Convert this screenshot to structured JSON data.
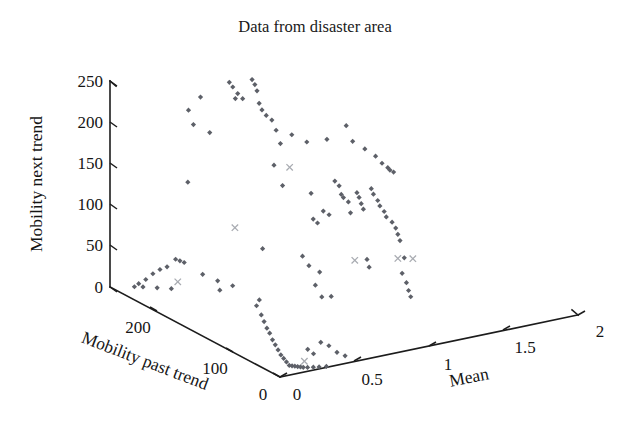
{
  "chart_data": {
    "type": "scatter",
    "projection": "3d",
    "title": "Data from disaster area",
    "xlabel": "Mean",
    "ylabel": "Mobility past trend",
    "zlabel": "Mobility next trend",
    "grid": false,
    "legend": "none",
    "axes": {
      "mean": {
        "label": "Mean",
        "ticks": [
          0,
          0.5,
          1,
          1.5,
          2
        ],
        "tick_labels": [
          "0",
          "0.5",
          "1",
          "1.5",
          "2"
        ],
        "range": [
          0,
          2
        ]
      },
      "mobility_past_trend": {
        "label": "Mobility past trend",
        "ticks": [
          0,
          100,
          200
        ],
        "tick_labels": [
          "0",
          "100",
          "200"
        ],
        "range": [
          0,
          260
        ]
      },
      "mobility_next_trend": {
        "label": "Mobility next trend",
        "ticks": [
          0,
          50,
          100,
          150,
          200,
          250
        ],
        "tick_labels": [
          "0",
          "50",
          "100",
          "150",
          "200",
          "250"
        ],
        "range": [
          0,
          265
        ]
      }
    },
    "series": [
      {
        "name": "observations",
        "marker": "diamond",
        "color": "#5d6068",
        "points": [
          {
            "mean": 0.52,
            "past": 196,
            "next": 271
          },
          {
            "mean": 0.53,
            "past": 193,
            "next": 266
          },
          {
            "mean": 0.55,
            "past": 190,
            "next": 258
          },
          {
            "mean": 0.57,
            "past": 187,
            "next": 252
          },
          {
            "mean": 0.62,
            "past": 184,
            "next": 276
          },
          {
            "mean": 0.63,
            "past": 182,
            "next": 270
          },
          {
            "mean": 0.64,
            "past": 181,
            "next": 262
          },
          {
            "mean": 0.65,
            "past": 180,
            "next": 246
          },
          {
            "mean": 0.66,
            "past": 178,
            "next": 238
          },
          {
            "mean": 0.68,
            "past": 176,
            "next": 231
          },
          {
            "mean": 0.6,
            "past": 205,
            "next": 243
          },
          {
            "mean": 0.41,
            "past": 215,
            "next": 248
          },
          {
            "mean": 0.36,
            "past": 222,
            "next": 230
          },
          {
            "mean": 0.38,
            "past": 219,
            "next": 212
          },
          {
            "mean": 0.45,
            "past": 210,
            "next": 203
          },
          {
            "mean": 0.7,
            "past": 172,
            "next": 226
          },
          {
            "mean": 0.72,
            "past": 170,
            "next": 213
          },
          {
            "mean": 0.74,
            "past": 168,
            "next": 196
          },
          {
            "mean": 0.79,
            "past": 162,
            "next": 208
          },
          {
            "mean": 0.86,
            "past": 155,
            "next": 199
          },
          {
            "mean": 0.96,
            "past": 147,
            "next": 202
          },
          {
            "mean": 1.05,
            "past": 138,
            "next": 220
          },
          {
            "mean": 1.08,
            "past": 135,
            "next": 200
          },
          {
            "mean": 1.14,
            "past": 130,
            "next": 190
          },
          {
            "mean": 1.19,
            "past": 125,
            "next": 181
          },
          {
            "mean": 1.22,
            "past": 122,
            "next": 172
          },
          {
            "mean": 1.25,
            "past": 120,
            "next": 166
          },
          {
            "mean": 1.26,
            "past": 119,
            "next": 163
          },
          {
            "mean": 1.28,
            "past": 118,
            "next": 160
          },
          {
            "mean": 0.71,
            "past": 171,
            "next": 168
          },
          {
            "mean": 0.75,
            "past": 167,
            "next": 142
          },
          {
            "mean": 0.36,
            "past": 223,
            "next": 137
          },
          {
            "mean": 0.88,
            "past": 153,
            "next": 133
          },
          {
            "mean": 1.0,
            "past": 144,
            "next": 148
          },
          {
            "mean": 1.02,
            "past": 142,
            "next": 142
          },
          {
            "mean": 1.03,
            "past": 141,
            "next": 131
          },
          {
            "mean": 1.04,
            "past": 140,
            "next": 127
          },
          {
            "mean": 1.06,
            "past": 137,
            "next": 122
          },
          {
            "mean": 1.1,
            "past": 133,
            "next": 134
          },
          {
            "mean": 1.11,
            "past": 132,
            "next": 128
          },
          {
            "mean": 1.12,
            "past": 131,
            "next": 120
          },
          {
            "mean": 1.13,
            "past": 130,
            "next": 113
          },
          {
            "mean": 1.17,
            "past": 127,
            "next": 139
          },
          {
            "mean": 1.18,
            "past": 126,
            "next": 132
          },
          {
            "mean": 1.2,
            "past": 124,
            "next": 124
          },
          {
            "mean": 1.21,
            "past": 123,
            "next": 117
          },
          {
            "mean": 1.23,
            "past": 121,
            "next": 110
          },
          {
            "mean": 1.24,
            "past": 120,
            "next": 103
          },
          {
            "mean": 1.27,
            "past": 118,
            "next": 96
          },
          {
            "mean": 1.29,
            "past": 117,
            "next": 88
          },
          {
            "mean": 1.3,
            "past": 116,
            "next": 80
          },
          {
            "mean": 1.31,
            "past": 115,
            "next": 72
          },
          {
            "mean": 0.89,
            "past": 152,
            "next": 100
          },
          {
            "mean": 0.91,
            "past": 150,
            "next": 95
          },
          {
            "mean": 0.94,
            "past": 148,
            "next": 110
          },
          {
            "mean": 0.97,
            "past": 146,
            "next": 105
          },
          {
            "mean": 1.07,
            "past": 136,
            "next": 108
          },
          {
            "mean": 0.66,
            "past": 177,
            "next": 60
          },
          {
            "mean": 0.84,
            "past": 157,
            "next": 52
          },
          {
            "mean": 1.15,
            "past": 129,
            "next": 48
          },
          {
            "mean": 1.33,
            "past": 113,
            "next": 50
          },
          {
            "mean": 0.87,
            "past": 154,
            "next": 40
          },
          {
            "mean": 0.92,
            "past": 149,
            "next": 32
          },
          {
            "mean": 1.16,
            "past": 128,
            "next": 38
          },
          {
            "mean": 1.32,
            "past": 114,
            "next": 30
          },
          {
            "mean": 0.3,
            "past": 228,
            "next": 38
          },
          {
            "mean": 0.32,
            "past": 226,
            "next": 36
          },
          {
            "mean": 0.34,
            "past": 224,
            "next": 34
          },
          {
            "mean": 0.26,
            "past": 232,
            "next": 28
          },
          {
            "mean": 0.23,
            "past": 236,
            "next": 24
          },
          {
            "mean": 0.2,
            "past": 240,
            "next": 18
          },
          {
            "mean": 0.17,
            "past": 244,
            "next": 10
          },
          {
            "mean": 0.14,
            "past": 248,
            "next": 4
          },
          {
            "mean": 0.42,
            "past": 214,
            "next": 20
          },
          {
            "mean": 0.49,
            "past": 207,
            "next": 12
          },
          {
            "mean": 0.56,
            "past": 200,
            "next": 6
          },
          {
            "mean": 0.9,
            "past": 151,
            "next": 15
          },
          {
            "mean": 1.34,
            "past": 112,
            "next": 18
          },
          {
            "mean": 1.35,
            "past": 111,
            "next": 8
          },
          {
            "mean": 0.12,
            "past": 250,
            "next": 0
          },
          {
            "mean": 0.16,
            "past": 246,
            "next": 0
          },
          {
            "mean": 0.22,
            "past": 238,
            "next": 0
          },
          {
            "mean": 0.28,
            "past": 230,
            "next": 0
          },
          {
            "mean": 0.5,
            "past": 206,
            "next": 0
          },
          {
            "mean": 0.93,
            "past": 148,
            "next": 0
          },
          {
            "mean": 0.98,
            "past": 145,
            "next": 0
          },
          {
            "mean": 1.36,
            "past": 110,
            "next": 0
          },
          {
            "mean": 0.05,
            "past": 40,
            "next": 60
          },
          {
            "mean": 0.06,
            "past": 38,
            "next": 52
          },
          {
            "mean": 0.07,
            "past": 36,
            "next": 44
          },
          {
            "mean": 0.08,
            "past": 34,
            "next": 38
          },
          {
            "mean": 0.09,
            "past": 32,
            "next": 30
          },
          {
            "mean": 0.1,
            "past": 30,
            "next": 24
          },
          {
            "mean": 0.11,
            "past": 28,
            "next": 18
          },
          {
            "mean": 0.12,
            "past": 26,
            "next": 12
          },
          {
            "mean": 0.13,
            "past": 24,
            "next": 8
          },
          {
            "mean": 0.14,
            "past": 22,
            "next": 4
          },
          {
            "mean": 0.15,
            "past": 20,
            "next": 0
          },
          {
            "mean": 0.16,
            "past": 18,
            "next": 0
          },
          {
            "mean": 0.17,
            "past": 16,
            "next": 0
          },
          {
            "mean": 0.18,
            "past": 14,
            "next": 0
          },
          {
            "mean": 0.19,
            "past": 12,
            "next": 0
          },
          {
            "mean": 0.2,
            "past": 10,
            "next": 0
          },
          {
            "mean": 0.22,
            "past": 8,
            "next": 0
          },
          {
            "mean": 0.25,
            "past": 6,
            "next": 0
          },
          {
            "mean": 0.28,
            "past": 4,
            "next": 0
          },
          {
            "mean": 0.32,
            "past": 2,
            "next": 0
          },
          {
            "mean": 0.04,
            "past": 45,
            "next": 70
          },
          {
            "mean": 0.05,
            "past": 43,
            "next": 78
          },
          {
            "mean": 0.23,
            "past": 10,
            "next": 22
          },
          {
            "mean": 0.26,
            "past": 8,
            "next": 16
          },
          {
            "mean": 0.3,
            "past": 6,
            "next": 30
          },
          {
            "mean": 0.35,
            "past": 5,
            "next": 24
          },
          {
            "mean": 0.4,
            "past": 4,
            "next": 14
          },
          {
            "mean": 0.45,
            "past": 3,
            "next": 8
          }
        ]
      },
      {
        "name": "outliers",
        "marker": "cross",
        "color": "#a8abb1",
        "points": [
          {
            "mean": 0.78,
            "past": 163,
            "next": 166
          },
          {
            "mean": 0.54,
            "past": 192,
            "next": 85
          },
          {
            "mean": 1.09,
            "past": 134,
            "next": 47
          },
          {
            "mean": 1.3,
            "past": 116,
            "next": 49
          },
          {
            "mean": 1.37,
            "past": 109,
            "next": 49
          },
          {
            "mean": 0.31,
            "past": 227,
            "next": 9
          },
          {
            "mean": 0.19,
            "past": 6,
            "next": 10
          }
        ]
      }
    ]
  },
  "title": {
    "text": "Data from disaster area"
  },
  "axis_labels": {
    "z": "Mobility next trend",
    "y": "Mobility past trend",
    "x": "Mean"
  },
  "z_ticks": [
    "250",
    "200",
    "150",
    "100",
    "50",
    "0"
  ],
  "y_ticks": [
    "200",
    "100",
    "0"
  ],
  "x_ticks": [
    "0",
    "0.5",
    "1",
    "1.5",
    "2"
  ]
}
